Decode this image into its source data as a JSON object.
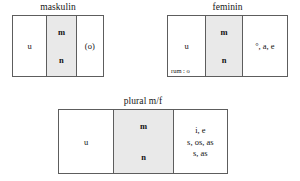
{
  "diagram": {
    "groups": [
      {
        "id": "maskulin",
        "title": "maskulin",
        "cells": {
          "left": "u",
          "middle_top": "m",
          "middle_bottom": "n",
          "right": "(o)"
        }
      },
      {
        "id": "feminin",
        "title": "feminin",
        "cells": {
          "left": "u",
          "left_note": "rum : o",
          "middle_top": "m",
          "middle_bottom": "n",
          "right": "°, a, e"
        }
      },
      {
        "id": "plural",
        "title": "plural m/f",
        "cells": {
          "left": "u",
          "middle_top": "m",
          "middle_bottom": "n",
          "right_line1": "i, e",
          "right_line2": "s, os, as",
          "right_line3": "s, as"
        }
      }
    ],
    "colors": {
      "shaded_cell": "#e9e9e9",
      "border": "#5d5d5d",
      "background": "#ffffff",
      "text": "#111111"
    }
  }
}
